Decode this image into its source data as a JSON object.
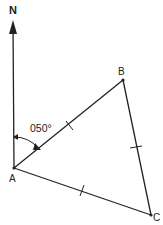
{
  "diagram": {
    "type": "bearing-triangle",
    "north_label": "N",
    "bearing_label": "050°",
    "points": {
      "A": {
        "label": "A",
        "x": 14,
        "y": 168
      },
      "B": {
        "label": "B",
        "x": 123,
        "y": 80
      },
      "C": {
        "label": "C",
        "x": 151,
        "y": 215
      }
    },
    "equal_side_ticks": [
      "AB",
      "BC",
      "AC"
    ],
    "stroke_color": "#222222"
  }
}
